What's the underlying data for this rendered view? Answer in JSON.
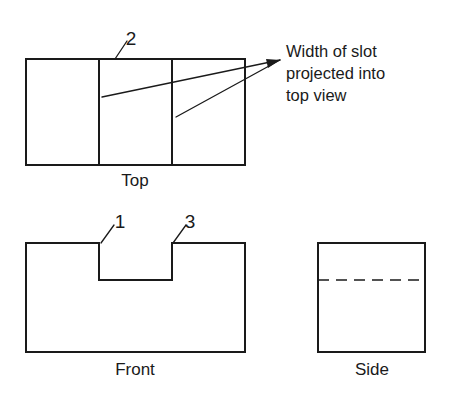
{
  "drawing": {
    "background_color": "#ffffff",
    "line_color": "#1a1a1a",
    "views": {
      "top": {
        "label": "Top",
        "label_x": 135,
        "label_y": 186,
        "outline": {
          "x": 26,
          "y": 59,
          "width": 219,
          "height": 106
        },
        "dividers": [
          {
            "x": 99,
            "y1": 59,
            "y2": 165
          },
          {
            "x": 172,
            "y1": 59,
            "y2": 165
          }
        ]
      },
      "front": {
        "label": "Front",
        "label_x": 135,
        "label_y": 375,
        "path": "M 26 243 L 99 243 L 99 280 L 172 280 L 172 243 L 245 243 L 245 352 L 26 352 Z"
      },
      "side": {
        "label": "Side",
        "label_x": 372,
        "label_y": 375,
        "outline": {
          "x": 318,
          "y": 243,
          "width": 107,
          "height": 109
        },
        "hidden_line": {
          "x1": 318,
          "x2": 425,
          "y": 280
        }
      }
    },
    "callouts": [
      {
        "name": "callout-2",
        "text": "2",
        "text_x": 131,
        "text_y": 45,
        "leader": "M 115 59 L 127 41"
      },
      {
        "name": "callout-1",
        "text": "1",
        "text_x": 120,
        "text_y": 228,
        "leader": "M 101 243 L 114 225"
      },
      {
        "name": "callout-3",
        "text": "3",
        "text_x": 190,
        "text_y": 228,
        "leader": "M 173 243 L 186 225"
      }
    ],
    "annotation": {
      "lines": [
        "Width of slot",
        "projected into",
        "top view"
      ],
      "x": 286,
      "y": 40,
      "leaders": [
        "M 102 97 L 280 60",
        "M 176 117 L 280 60"
      ],
      "arrowhead": "M 280 60 L 266 59 L 268 68 Z"
    }
  }
}
